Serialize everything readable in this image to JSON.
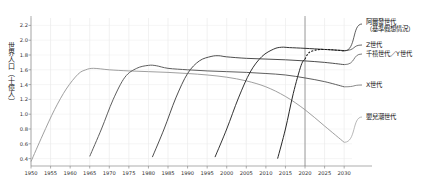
{
  "chart_data": {
    "type": "line",
    "title": "",
    "xlabel": "",
    "ylabel": "世界人口（十億人）",
    "xlim": [
      1950,
      2032
    ],
    "ylim": [
      0.3,
      2.3
    ],
    "grid": true,
    "legend_position": "right",
    "xticks": [
      "1950",
      "1955",
      "1960",
      "1965",
      "1970",
      "1975",
      "1980",
      "1985",
      "1990",
      "1995",
      "2000",
      "2005",
      "2010",
      "2015",
      "2020",
      "2025",
      "2030"
    ],
    "yticks": [
      "0.4",
      "0.6",
      "0.8",
      "1.0",
      "1.2",
      "1.4",
      "1.6",
      "1.8",
      "2.0",
      "2.2"
    ],
    "annotations": [
      {
        "name": "present-year-marker",
        "x": 2020,
        "label": ""
      }
    ],
    "series": [
      {
        "name": "嬰兒潮世代",
        "color": "#9a9a9a",
        "style": "solid",
        "x": [
          1950,
          1953,
          1956,
          1959,
          1962,
          1964,
          1966,
          1970,
          1975,
          1980,
          1985,
          1990,
          1995,
          2000,
          2005,
          2010,
          2015,
          2020,
          2025,
          2030
        ],
        "values": [
          0.36,
          0.72,
          1.06,
          1.34,
          1.54,
          1.6,
          1.62,
          1.6,
          1.585,
          1.575,
          1.565,
          1.55,
          1.53,
          1.5,
          1.45,
          1.37,
          1.24,
          1.06,
          0.84,
          0.62
        ]
      },
      {
        "name": "X世代",
        "color": "#555555",
        "style": "solid",
        "x": [
          1965,
          1968,
          1971,
          1974,
          1977,
          1980,
          1982,
          1985,
          1990,
          1995,
          2000,
          2005,
          2010,
          2015,
          2020,
          2025,
          2030
        ],
        "values": [
          0.43,
          0.8,
          1.2,
          1.5,
          1.62,
          1.66,
          1.655,
          1.62,
          1.6,
          1.585,
          1.575,
          1.565,
          1.55,
          1.53,
          1.49,
          1.44,
          1.37
        ]
      },
      {
        "name": "千禧世代／Y世代",
        "color": "#444444",
        "style": "solid",
        "x": [
          1981,
          1984,
          1987,
          1990,
          1993,
          1996,
          1998,
          2000,
          2005,
          2010,
          2015,
          2020,
          2025,
          2030
        ],
        "values": [
          0.42,
          0.8,
          1.22,
          1.55,
          1.72,
          1.78,
          1.79,
          1.775,
          1.755,
          1.745,
          1.735,
          1.72,
          1.7,
          1.67
        ]
      },
      {
        "name": "Z世代",
        "color": "#2a2a2a",
        "style": "solid",
        "x": [
          1997,
          2000,
          2003,
          2006,
          2009,
          2012,
          2014,
          2016,
          2020,
          2025,
          2030
        ],
        "values": [
          0.42,
          0.8,
          1.22,
          1.57,
          1.78,
          1.88,
          1.905,
          1.9,
          1.89,
          1.875,
          1.86
        ]
      },
      {
        "name": "阿爾發世代（基準假想情況）",
        "color": "#1a1a1a",
        "style": "solid-then-dashed",
        "dash_from_x": 2020,
        "x": [
          2013,
          2015,
          2017,
          2019,
          2021,
          2023,
          2025,
          2027,
          2030
        ],
        "values": [
          0.4,
          0.8,
          1.28,
          1.66,
          1.83,
          1.87,
          1.875,
          1.87,
          1.855
        ]
      }
    ]
  },
  "axis": {
    "y_title": "世界人口（十億人）"
  },
  "legend": {
    "items": [
      {
        "id": "alpha",
        "line1": "阿爾發世代",
        "line2": "（基準假想情況）"
      },
      {
        "id": "genz",
        "line1": "Z世代",
        "line2": ""
      },
      {
        "id": "millennial",
        "line1": "千禧世代／Y世代",
        "line2": ""
      },
      {
        "id": "genx",
        "line1": "X世代",
        "line2": ""
      },
      {
        "id": "boomer",
        "line1": "嬰兒潮世代",
        "line2": ""
      }
    ]
  }
}
